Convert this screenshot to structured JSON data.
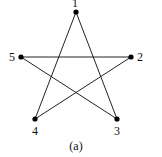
{
  "diagram": {
    "caption": "(a)",
    "nodes": [
      {
        "id": "1",
        "label": "1",
        "x": 76,
        "y": 12,
        "lx": 75,
        "ly": 7
      },
      {
        "id": "2",
        "label": "2",
        "x": 131,
        "y": 57,
        "lx": 140,
        "ly": 61
      },
      {
        "id": "3",
        "label": "3",
        "x": 117,
        "y": 119,
        "lx": 117,
        "ly": 135
      },
      {
        "id": "4",
        "label": "4",
        "x": 35,
        "y": 119,
        "lx": 35,
        "ly": 135
      },
      {
        "id": "5",
        "label": "5",
        "x": 21,
        "y": 57,
        "lx": 12,
        "ly": 61
      }
    ],
    "edges": [
      {
        "from": "1",
        "to": "4"
      },
      {
        "from": "1",
        "to": "3"
      },
      {
        "from": "5",
        "to": "2"
      },
      {
        "from": "5",
        "to": "3"
      },
      {
        "from": "2",
        "to": "4"
      }
    ]
  }
}
